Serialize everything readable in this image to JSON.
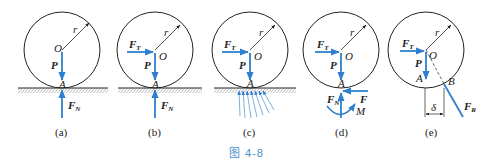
{
  "figure": {
    "caption": "图 4-8",
    "color_force": "#2f7fd0",
    "color_line": "#222222",
    "color_caption": "#4a8fc9"
  },
  "labels": {
    "center": "O",
    "radius": "r",
    "contact": "A",
    "weight": "P",
    "normal": "F",
    "normal_sub": "N",
    "traction": "F",
    "traction_sub": "T",
    "friction": "F",
    "moment": "M",
    "point_b": "B",
    "resultant": "F",
    "resultant_sub": "R",
    "offset": "δ"
  },
  "panels": [
    {
      "id": "a",
      "caption": "(a)"
    },
    {
      "id": "b",
      "caption": "(b)"
    },
    {
      "id": "c",
      "caption": "(c)"
    },
    {
      "id": "d",
      "caption": "(d)"
    },
    {
      "id": "e",
      "caption": "(e)"
    }
  ]
}
